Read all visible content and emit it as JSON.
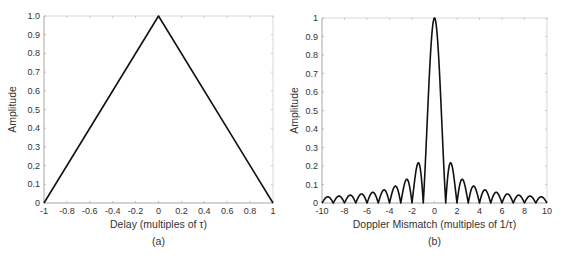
{
  "chart_data": [
    {
      "type": "line",
      "title": "",
      "caption": "(a)",
      "xlabel": "Delay (multiples of τ)",
      "ylabel": "Amplitude",
      "xlim": [
        -1,
        1
      ],
      "ylim": [
        0,
        1
      ],
      "xticks": [
        "-1",
        "-0.8",
        "-0.6",
        "-0.4",
        "-0.2",
        "0",
        "0.2",
        "0.4",
        "0.6",
        "0.8",
        "1"
      ],
      "yticks": [
        "0",
        "0.1",
        "0.2",
        "0.3",
        "0.4",
        "0.5",
        "0.6",
        "0.7",
        "0.8",
        "0.9",
        "1.0"
      ],
      "grid": false,
      "series": [
        {
          "name": "zero-Doppler cut",
          "x": [
            -1,
            0,
            1
          ],
          "y": [
            0,
            1,
            0
          ]
        }
      ]
    },
    {
      "type": "line",
      "title": "",
      "caption": "(b)",
      "xlabel": "Doppler  Mismatch (multiples of 1/τ)",
      "ylabel": "Amplitude",
      "xlim": [
        -10,
        10
      ],
      "ylim": [
        0,
        1
      ],
      "xticks": [
        "-10",
        "-8",
        "-6",
        "-4",
        "-2",
        "0",
        "2",
        "4",
        "6",
        "8",
        "10"
      ],
      "yticks": [
        "0",
        "0.1",
        "0.2",
        "0.3",
        "0.4",
        "0.5",
        "0.6",
        "0.7",
        "0.8",
        "0.9",
        "1"
      ],
      "grid": false,
      "series": [
        {
          "name": "zero-delay cut |sinc(x)|",
          "function": "abs(sin(pi*x)/(pi*x))",
          "x": [
            -9.5,
            -8.5,
            -7.5,
            -6.5,
            -5.5,
            -4.5,
            -3.5,
            -2.5,
            -1.5,
            0,
            1.5,
            2.5,
            3.5,
            4.5,
            5.5,
            6.5,
            7.5,
            8.5,
            9.5
          ],
          "y": [
            0.034,
            0.037,
            0.042,
            0.049,
            0.058,
            0.071,
            0.091,
            0.127,
            0.212,
            1.0,
            0.212,
            0.127,
            0.091,
            0.071,
            0.058,
            0.049,
            0.042,
            0.037,
            0.034
          ]
        }
      ]
    }
  ]
}
